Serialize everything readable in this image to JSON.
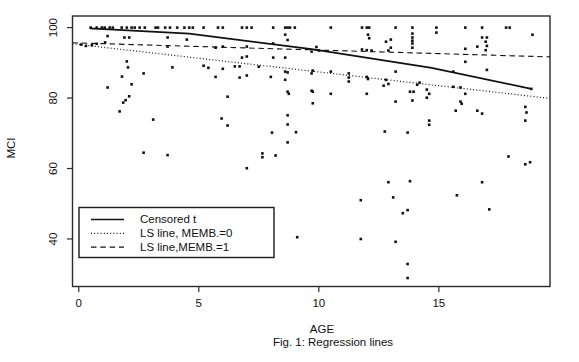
{
  "figure": {
    "caption": "Fig. 1: Regression lines",
    "background": "#ffffff",
    "ink_color": "#111111"
  },
  "chart_data": {
    "type": "scatter",
    "title": "",
    "xlabel": "AGE",
    "ylabel": "MCI",
    "xlim": [
      -0.26,
      19.63
    ],
    "ylim": [
      26.5,
      103.3
    ],
    "xticks": [
      0,
      5,
      10,
      15
    ],
    "yticks": [
      40,
      60,
      80,
      100
    ],
    "grid": false,
    "legend": {
      "position": "lower-left",
      "entries": [
        {
          "label": "Censored t",
          "style": "solid"
        },
        {
          "label": "LS line, MEMB.=0",
          "style": "dotted"
        },
        {
          "label": "LS line,MEMB.=1",
          "style": "dashed"
        }
      ]
    },
    "series": [
      {
        "name": "Censored t",
        "type": "line",
        "style": "solid",
        "points": [
          [
            0.46,
            99.8
          ],
          [
            4.6,
            98.3
          ],
          [
            9.7,
            93.9
          ],
          [
            14.7,
            88.6
          ],
          [
            18.85,
            82.6
          ]
        ]
      },
      {
        "name": "LS line, MEMB.=0",
        "type": "line",
        "style": "dotted",
        "points": [
          [
            -0.26,
            95.4
          ],
          [
            19.63,
            79.9
          ]
        ]
      },
      {
        "name": "LS line,MEMB.=1",
        "type": "line",
        "style": "dashed",
        "points": [
          [
            -0.26,
            95.7
          ],
          [
            19.63,
            91.7
          ]
        ]
      },
      {
        "name": "observations",
        "type": "scatter",
        "points": [
          [
            0.5,
            100
          ],
          [
            0.75,
            100
          ],
          [
            0.96,
            100
          ],
          [
            1.08,
            100
          ],
          [
            1.29,
            100
          ],
          [
            1.42,
            100
          ],
          [
            1.79,
            100
          ],
          [
            2.0,
            100
          ],
          [
            2.2,
            100
          ],
          [
            2.33,
            100
          ],
          [
            2.54,
            100
          ],
          [
            2.75,
            100
          ],
          [
            3.2,
            100
          ],
          [
            3.3,
            100
          ],
          [
            3.6,
            100
          ],
          [
            3.8,
            100
          ],
          [
            4.1,
            100
          ],
          [
            4.4,
            100
          ],
          [
            4.6,
            100
          ],
          [
            4.75,
            100
          ],
          [
            5.2,
            100
          ],
          [
            5.8,
            100
          ],
          [
            6.0,
            100
          ],
          [
            6.8,
            100
          ],
          [
            7.0,
            100
          ],
          [
            7.2,
            100
          ],
          [
            8.1,
            100
          ],
          [
            8.6,
            100
          ],
          [
            8.7,
            100
          ],
          [
            8.8,
            100
          ],
          [
            9.0,
            100
          ],
          [
            10.5,
            100
          ],
          [
            11.8,
            100
          ],
          [
            12.0,
            100
          ],
          [
            12.1,
            100
          ],
          [
            13.2,
            100
          ],
          [
            13.9,
            100
          ],
          [
            14.9,
            100
          ],
          [
            16.1,
            100
          ],
          [
            16.8,
            100
          ],
          [
            17.8,
            100
          ],
          [
            17.95,
            100
          ],
          [
            1.2,
            97.6
          ],
          [
            1.9,
            97.2
          ],
          [
            2.1,
            97.2
          ],
          [
            3.7,
            97.2
          ],
          [
            4.5,
            96.6
          ],
          [
            18.9,
            98.0
          ],
          [
            0.1,
            95.2
          ],
          [
            0.3,
            94.8
          ],
          [
            0.55,
            95.0
          ],
          [
            0.75,
            95.4
          ],
          [
            1.1,
            95.8
          ],
          [
            3.7,
            94.6
          ],
          [
            2.0,
            90.4
          ],
          [
            2.05,
            88.7
          ],
          [
            3.9,
            88.7
          ],
          [
            2.7,
            87.0
          ],
          [
            1.8,
            86.1
          ],
          [
            2.2,
            83.9
          ],
          [
            1.2,
            83.0
          ],
          [
            2.1,
            80.5
          ],
          [
            1.85,
            78.7
          ],
          [
            1.95,
            79.4
          ],
          [
            1.7,
            76.2
          ],
          [
            3.1,
            73.9
          ],
          [
            2.7,
            64.5
          ],
          [
            3.7,
            63.8
          ],
          [
            5.7,
            94.3
          ],
          [
            6.0,
            94.6
          ],
          [
            7.0,
            94.6
          ],
          [
            8.1,
            95.5
          ],
          [
            6.8,
            91.5
          ],
          [
            7.0,
            91.8
          ],
          [
            8.1,
            91.5
          ],
          [
            8.6,
            91.5
          ],
          [
            5.2,
            89.2
          ],
          [
            5.4,
            88.6
          ],
          [
            6.0,
            88.3
          ],
          [
            6.5,
            89.0
          ],
          [
            6.7,
            89.0
          ],
          [
            7.5,
            88.9
          ],
          [
            8.6,
            87.5
          ],
          [
            8.7,
            87.3
          ],
          [
            5.7,
            86.0
          ],
          [
            6.7,
            85.8
          ],
          [
            7.0,
            86.4
          ],
          [
            8.0,
            86.0
          ],
          [
            8.6,
            85.2
          ],
          [
            8.7,
            81.8
          ],
          [
            8.75,
            81.2
          ],
          [
            6.2,
            80.4
          ],
          [
            8.6,
            98.0
          ],
          [
            8.7,
            96.5
          ],
          [
            8.7,
            75.1
          ],
          [
            5.95,
            74.2
          ],
          [
            6.2,
            72.2
          ],
          [
            8.7,
            72.5
          ],
          [
            8.05,
            70.2
          ],
          [
            9.05,
            70.3
          ],
          [
            8.7,
            67.4
          ],
          [
            7.65,
            64.3
          ],
          [
            7.65,
            63.2
          ],
          [
            8.2,
            63.7
          ],
          [
            7.0,
            60.1
          ],
          [
            9.1,
            40.5
          ],
          [
            9.9,
            94.5
          ],
          [
            10.0,
            93.5
          ],
          [
            9.7,
            93.2
          ],
          [
            11.8,
            93.8
          ],
          [
            12.0,
            93.6
          ],
          [
            12.2,
            93.5
          ],
          [
            12.9,
            93.5
          ],
          [
            13.0,
            94.3
          ],
          [
            13.9,
            98.3
          ],
          [
            13.9,
            97.2
          ],
          [
            13.9,
            96.3
          ],
          [
            13.9,
            95.5
          ],
          [
            13.9,
            94.3
          ],
          [
            12.05,
            98.0
          ],
          [
            12.1,
            97.0
          ],
          [
            12.8,
            96.0
          ],
          [
            13.0,
            96.6
          ],
          [
            9.75,
            87.8
          ],
          [
            9.7,
            87.0
          ],
          [
            10.5,
            87.5
          ],
          [
            11.25,
            87.0
          ],
          [
            11.25,
            85.8
          ],
          [
            11.25,
            84.7
          ],
          [
            12.0,
            86.0
          ],
          [
            12.05,
            85.4
          ],
          [
            12.8,
            85.2
          ],
          [
            12.7,
            83.5
          ],
          [
            12.9,
            84.0
          ],
          [
            13.2,
            87.5
          ],
          [
            14.1,
            83.8
          ],
          [
            14.2,
            84.4
          ],
          [
            9.7,
            82.1
          ],
          [
            9.75,
            81.8
          ],
          [
            9.75,
            78.5
          ],
          [
            10.5,
            81.2
          ],
          [
            12.0,
            81.2
          ],
          [
            13.8,
            81.8
          ],
          [
            13.95,
            81.8
          ],
          [
            14.5,
            82.4
          ],
          [
            14.6,
            81.2
          ],
          [
            13.2,
            79.0
          ],
          [
            13.9,
            79.3
          ],
          [
            14.5,
            80.1
          ],
          [
            14.6,
            73.6
          ],
          [
            14.6,
            72.4
          ],
          [
            12.75,
            70.5
          ],
          [
            13.7,
            70.2
          ],
          [
            12.9,
            56.1
          ],
          [
            13.8,
            56.4
          ],
          [
            11.75,
            51.0
          ],
          [
            13.1,
            51.8
          ],
          [
            13.5,
            47.3
          ],
          [
            13.7,
            48.2
          ],
          [
            11.75,
            40.0
          ],
          [
            13.2,
            39.2
          ],
          [
            13.7,
            32.9
          ],
          [
            13.7,
            28.9
          ],
          [
            14.9,
            98.6
          ],
          [
            16.8,
            97.2
          ],
          [
            17.0,
            97.2
          ],
          [
            16.95,
            96.0
          ],
          [
            17.0,
            94.8
          ],
          [
            16.95,
            93.6
          ],
          [
            16.6,
            94.6
          ],
          [
            16.1,
            94.0
          ],
          [
            16.1,
            90.3
          ],
          [
            15.6,
            87.5
          ],
          [
            17.0,
            88.0
          ],
          [
            15.6,
            83.2
          ],
          [
            15.9,
            83.0
          ],
          [
            16.1,
            81.2
          ],
          [
            15.9,
            79.0
          ],
          [
            15.95,
            78.4
          ],
          [
            15.7,
            76.4
          ],
          [
            16.6,
            76.4
          ],
          [
            16.8,
            75.6
          ],
          [
            18.6,
            77.5
          ],
          [
            18.65,
            75.9
          ],
          [
            18.6,
            73.6
          ],
          [
            18.85,
            82.6
          ],
          [
            17.9,
            63.4
          ],
          [
            18.6,
            61.2
          ],
          [
            18.8,
            61.8
          ],
          [
            16.8,
            56.1
          ],
          [
            15.75,
            52.4
          ],
          [
            17.1,
            48.4
          ]
        ]
      }
    ]
  }
}
